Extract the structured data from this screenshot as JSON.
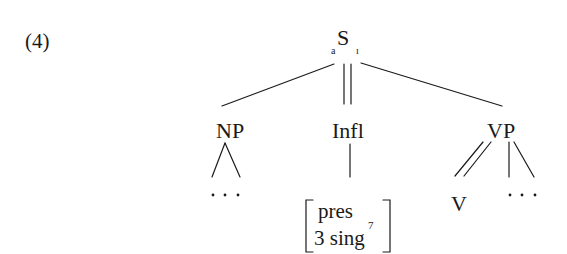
{
  "example": {
    "number": "(4)"
  },
  "tree": {
    "root": {
      "label": "S",
      "left_subscript": "a",
      "right_subscript": "ı"
    },
    "children": [
      {
        "id": "np",
        "label": "NP",
        "edge_from_parent": "single",
        "daughters": [
          {
            "label": "…",
            "edge": "triangle"
          }
        ]
      },
      {
        "id": "infl",
        "label": "Infl",
        "edge_from_parent": "double",
        "daughters": [
          {
            "feature_matrix": {
              "row1": "pres",
              "row1_subscript": "7",
              "row2": "3 sing"
            },
            "edge": "single"
          }
        ]
      },
      {
        "id": "vp",
        "label": "VP",
        "edge_from_parent": "single",
        "daughters": [
          {
            "label": "V",
            "edge": "double"
          },
          {
            "label": "…",
            "edge": "fork"
          }
        ]
      }
    ]
  },
  "colors": {
    "ink": "#1a1a1a",
    "background": "#ffffff"
  }
}
